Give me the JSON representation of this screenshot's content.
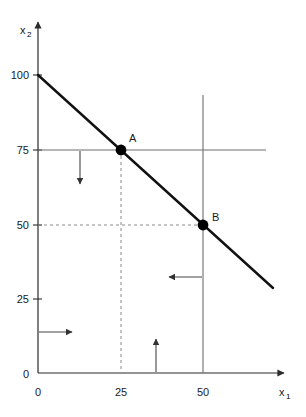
{
  "figure": {
    "type": "economics-budget-line-diagram",
    "background_color": "#ffffff",
    "axes": {
      "x_title": "x",
      "x_subscript": "1",
      "y_title": "x",
      "y_subscript": "2",
      "axis_color": "#2b2b2b",
      "origin_label": "0",
      "x_ticks": [
        {
          "label": "0",
          "value": 0
        },
        {
          "label": "25",
          "value": 25
        },
        {
          "label": "50",
          "value": 50
        }
      ],
      "y_ticks": [
        {
          "label": "25",
          "value": 25
        },
        {
          "label": "50",
          "value": 50
        },
        {
          "label": "75",
          "value": 75
        },
        {
          "label": "100",
          "value": 100
        }
      ],
      "x_range": [
        0,
        75
      ],
      "y_range": [
        0,
        112
      ]
    },
    "budget_line": {
      "color": "#111111",
      "from": {
        "x": 0,
        "y": 100
      },
      "to": {
        "x": 71,
        "y": 29
      },
      "slope": -1
    },
    "points": [
      {
        "label": "A",
        "x": 25,
        "y": 75,
        "marker": "filled-circle",
        "color": "#000000"
      },
      {
        "label": "B",
        "x": 50,
        "y": 50,
        "marker": "filled-circle",
        "color": "#000000"
      }
    ],
    "constraint_lines": [
      {
        "name": "horizontal-constraint-75",
        "orientation": "horizontal",
        "value": 75,
        "style": "solid",
        "color": "#6e6e6e"
      },
      {
        "name": "vertical-constraint-50",
        "orientation": "vertical",
        "value": 50,
        "style": "solid",
        "color": "#6e6e6e"
      }
    ],
    "guide_lines": [
      {
        "name": "dashed-vertical-from-a",
        "orientation": "vertical",
        "value": 25,
        "style": "dashed",
        "color": "#8a8a8a"
      },
      {
        "name": "dashed-horizontal-to-b",
        "orientation": "horizontal",
        "value": 50,
        "style": "dashed",
        "color": "#8a8a8a"
      }
    ],
    "arrows": [
      {
        "name": "arrow-down-below-75",
        "direction": "down",
        "color": "#555555"
      },
      {
        "name": "arrow-right-from-axis",
        "direction": "right",
        "color": "#555555"
      },
      {
        "name": "arrow-up-from-axis",
        "direction": "up",
        "color": "#555555"
      },
      {
        "name": "arrow-left-from-50",
        "direction": "left",
        "color": "#555555"
      }
    ]
  }
}
